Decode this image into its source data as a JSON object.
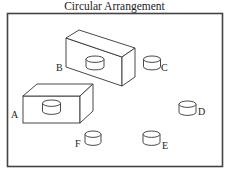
{
  "title": "Circular Arrangement",
  "colors": {
    "stroke": "#333333",
    "frame": "#444444",
    "text": "#222222",
    "background": "#ffffff"
  },
  "positions": [
    {
      "id": "A",
      "label": "A",
      "object": "cylinder-on-box"
    },
    {
      "id": "B",
      "label": "B",
      "object": "cylinder-on-box"
    },
    {
      "id": "C",
      "label": "C",
      "object": "cylinder"
    },
    {
      "id": "D",
      "label": "D",
      "object": "cylinder"
    },
    {
      "id": "E",
      "label": "E",
      "object": "cylinder"
    },
    {
      "id": "F",
      "label": "F",
      "object": "cylinder"
    }
  ]
}
